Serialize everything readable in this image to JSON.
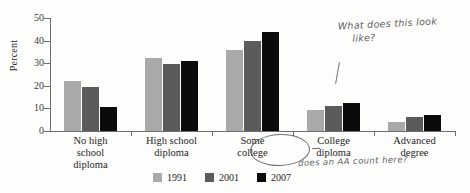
{
  "chart_data": {
    "type": "bar",
    "title": "",
    "xlabel": "",
    "ylabel": "Percent",
    "ylim": [
      0,
      50
    ],
    "yticks": [
      0,
      10,
      20,
      30,
      40,
      50
    ],
    "grid": false,
    "legend_position": "bottom",
    "categories": [
      "No high school diploma",
      "High school diploma",
      "Some college",
      "College diploma",
      "Advanced degree"
    ],
    "category_lines": [
      [
        "No high",
        "school",
        "diploma"
      ],
      [
        "High school",
        "diploma"
      ],
      [
        "Some",
        "college"
      ],
      [
        "College",
        "diploma"
      ],
      [
        "Advanced",
        "degree"
      ]
    ],
    "series": [
      {
        "name": "1991",
        "color": "#a9a9a9",
        "values": [
          22,
          32.5,
          36,
          9.5,
          4
        ]
      },
      {
        "name": "2001",
        "color": "#5b5b5b",
        "values": [
          19.5,
          29.5,
          40,
          11,
          6
        ]
      },
      {
        "name": "2007",
        "color": "#0b0b0b",
        "values": [
          10.5,
          31,
          44,
          12.5,
          7
        ]
      }
    ]
  },
  "annotations": {
    "question_line1": "What does this look",
    "question_line2": "like?",
    "aa_note": "does an AA count here?",
    "circled_category": "Some college"
  }
}
